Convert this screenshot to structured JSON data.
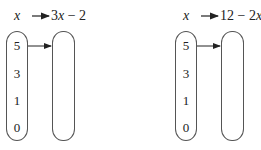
{
  "diagrams": [
    {
      "input_label": "x",
      "output_label": "3x − 2",
      "inputs": [
        "5",
        "3",
        "1",
        "0"
      ],
      "outputs": []
    },
    {
      "input_label": "x",
      "output_label": "12 − 2x",
      "inputs": [
        "5",
        "3",
        "1",
        "0"
      ],
      "outputs": []
    }
  ]
}
